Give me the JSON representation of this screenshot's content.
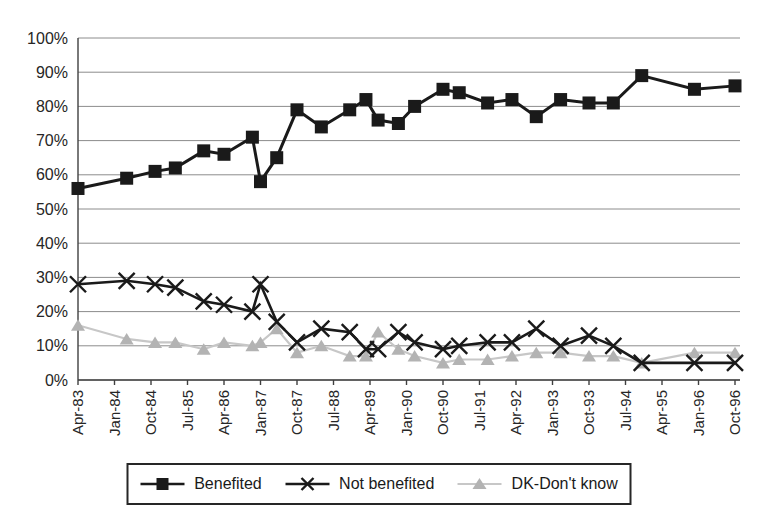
{
  "chart_data": {
    "type": "line",
    "x_unit": "months since Apr-83",
    "x_tick_interval_months": 9,
    "x_tick_labels": [
      "Apr-83",
      "Jan-84",
      "Oct-84",
      "Jul-85",
      "Apr-86",
      "Jan-87",
      "Oct-87",
      "Jul-88",
      "Apr-89",
      "Jan-90",
      "Oct-90",
      "Jul-91",
      "Apr-92",
      "Jan-93",
      "Oct-93",
      "Jul-94",
      "Apr-95",
      "Jan-96",
      "Oct-96"
    ],
    "y_tick_labels": [
      "0%",
      "10%",
      "20%",
      "30%",
      "40%",
      "50%",
      "60%",
      "70%",
      "80%",
      "90%",
      "100%"
    ],
    "ylim": [
      0,
      100
    ],
    "grid": true,
    "legend_position": "bottom",
    "survey_months": [
      0,
      12,
      19,
      24,
      31,
      36,
      43,
      45,
      49,
      54,
      60,
      67,
      71,
      74,
      79,
      83,
      90,
      94,
      101,
      107,
      113,
      119,
      126,
      132,
      139,
      152,
      162
    ],
    "series": [
      {
        "name": "Benefited",
        "marker": "square",
        "color": "#1a1a1a",
        "values": [
          56,
          59,
          61,
          62,
          67,
          66,
          71,
          58,
          65,
          79,
          74,
          79,
          82,
          76,
          75,
          80,
          85,
          84,
          81,
          82,
          77,
          82,
          81,
          81,
          89,
          85,
          86
        ]
      },
      {
        "name": "Not benefited",
        "marker": "x",
        "color": "#1a1a1a",
        "values": [
          28,
          29,
          28,
          27,
          23,
          22,
          20,
          28,
          17,
          11,
          15,
          14,
          9,
          9,
          14,
          11,
          9,
          10,
          11,
          11,
          15,
          10,
          13,
          10,
          5,
          5,
          5
        ]
      },
      {
        "name": "DK-Don't know",
        "marker": "triangle",
        "color": "#b3b3b3",
        "line_color": "#c7c7c7",
        "values": [
          16,
          12,
          11,
          11,
          9,
          11,
          10,
          11,
          15,
          8,
          10,
          7,
          7,
          14,
          9,
          7,
          5,
          6,
          6,
          7,
          8,
          8,
          7,
          7,
          5,
          8,
          8
        ]
      }
    ]
  },
  "legend": {
    "items": [
      "Benefited",
      "Not benefited",
      "DK-Don't know"
    ]
  }
}
